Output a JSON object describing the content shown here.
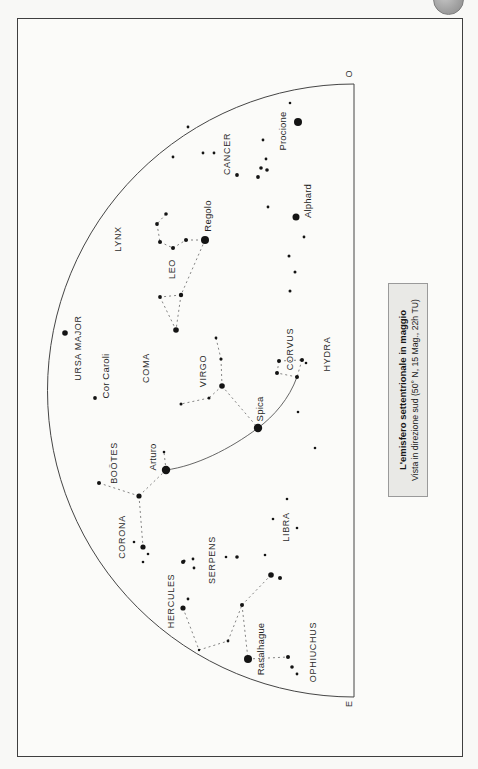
{
  "caption": {
    "title": "L'emisfero settentrionale in maggio",
    "subtitle": "Vista in direzione sud (50° N, 15 Mag., 22h TU)"
  },
  "horizon": {
    "west_label": "O",
    "east_label": "E"
  },
  "colors": {
    "star": "#141414",
    "figure_line": "#666666",
    "guide_line": "#555555",
    "outline": "#454545",
    "caption_bg": "#e9e9e6",
    "badge": "#a3a3a3"
  },
  "map": {
    "constellation_labels": [
      {
        "label": "LYNX",
        "x": 118,
        "y": 239
      },
      {
        "label": "CANCER",
        "x": 227,
        "y": 154
      },
      {
        "label": "URSA MAJOR",
        "x": 78,
        "y": 348
      },
      {
        "label": "LEO",
        "x": 172,
        "y": 269
      },
      {
        "label": "COMA",
        "x": 146,
        "y": 368
      },
      {
        "label": "VIRGO",
        "x": 203,
        "y": 371
      },
      {
        "label": "CORVUS",
        "x": 290,
        "y": 349
      },
      {
        "label": "HYDRA",
        "x": 327,
        "y": 354
      },
      {
        "label": "BOÖTES",
        "x": 114,
        "y": 463
      },
      {
        "label": "CORONA",
        "x": 122,
        "y": 537
      },
      {
        "label": "LIBRA",
        "x": 286,
        "y": 527
      },
      {
        "label": "SERPENS",
        "x": 212,
        "y": 560
      },
      {
        "label": "HERCULES",
        "x": 171,
        "y": 601
      },
      {
        "label": "OPHIUCHUS",
        "x": 313,
        "y": 652
      }
    ],
    "star_labels": [
      {
        "label": "Procione",
        "x": 283,
        "y": 131
      },
      {
        "label": "Regolo",
        "x": 208,
        "y": 216
      },
      {
        "label": "Alphard",
        "x": 308,
        "y": 201
      },
      {
        "label": "Cor Caroli",
        "x": 106,
        "y": 376
      },
      {
        "label": "Arturo",
        "x": 153,
        "y": 457
      },
      {
        "label": "Spica",
        "x": 260,
        "y": 409
      },
      {
        "label": "Rasalhague",
        "x": 261,
        "y": 649
      }
    ],
    "stars": [
      [
        290,
        103,
        1.3
      ],
      [
        298,
        122,
        4.0
      ],
      [
        188,
        127,
        1.4
      ],
      [
        173,
        157,
        1.4
      ],
      [
        203,
        153,
        1.4
      ],
      [
        214,
        153,
        1.4
      ],
      [
        263,
        140,
        1.4
      ],
      [
        266,
        159,
        1.4
      ],
      [
        261,
        168,
        1.8
      ],
      [
        267,
        170,
        1.8
      ],
      [
        258,
        177,
        1.9
      ],
      [
        237,
        175,
        1.9
      ],
      [
        268,
        207,
        1.4
      ],
      [
        296,
        217,
        3.5
      ],
      [
        304,
        237,
        1.4
      ],
      [
        289,
        256,
        1.5
      ],
      [
        295,
        272,
        1.5
      ],
      [
        290,
        291,
        1.5
      ],
      [
        166,
        214,
        1.8
      ],
      [
        157,
        224,
        1.9
      ],
      [
        160,
        242,
        2.0
      ],
      [
        173,
        248,
        2.0
      ],
      [
        186,
        240,
        2.0
      ],
      [
        205,
        240,
        4.0
      ],
      [
        160,
        297,
        1.9
      ],
      [
        181,
        295,
        2.2
      ],
      [
        176,
        330,
        2.8
      ],
      [
        65,
        333,
        2.8
      ],
      [
        95,
        398,
        1.9
      ],
      [
        216,
        338,
        1.4
      ],
      [
        221,
        359,
        1.6
      ],
      [
        222,
        386,
        2.8
      ],
      [
        209,
        398,
        1.5
      ],
      [
        181,
        404,
        1.5
      ],
      [
        258,
        428,
        4.2
      ],
      [
        279,
        361,
        2.0
      ],
      [
        302,
        360,
        2.0
      ],
      [
        306,
        363,
        1.3
      ],
      [
        277,
        373,
        2.0
      ],
      [
        297,
        377,
        2.0
      ],
      [
        298,
        412,
        1.3
      ],
      [
        315,
        448,
        1.3
      ],
      [
        287,
        499,
        1.3
      ],
      [
        273,
        519,
        1.3
      ],
      [
        297,
        528,
        1.3
      ],
      [
        265,
        555,
        1.3
      ],
      [
        237,
        557,
        1.8
      ],
      [
        226,
        557,
        1.3
      ],
      [
        164,
        452,
        1.3
      ],
      [
        166,
        470,
        4.2
      ],
      [
        139,
        496,
        2.6
      ],
      [
        99,
        483,
        2.0
      ],
      [
        134,
        542,
        1.3
      ],
      [
        143,
        547,
        2.6
      ],
      [
        148,
        554,
        1.3
      ],
      [
        143,
        562,
        1.3
      ],
      [
        184,
        561,
        1.6
      ],
      [
        193,
        559,
        1.4
      ],
      [
        194,
        568,
        1.4
      ],
      [
        271,
        575,
        2.8
      ],
      [
        280,
        578,
        2.0
      ],
      [
        183,
        562,
        2.0
      ],
      [
        188,
        599,
        1.4
      ],
      [
        183,
        608,
        2.6
      ],
      [
        199,
        650,
        1.2
      ],
      [
        228,
        641,
        1.4
      ],
      [
        242,
        605,
        2.0
      ],
      [
        248,
        659,
        4.0
      ],
      [
        288,
        657,
        2.0
      ],
      [
        292,
        667,
        1.8
      ],
      [
        297,
        674,
        1.4
      ]
    ],
    "figure_lines": [
      [
        166,
        214,
        157,
        224
      ],
      [
        157,
        224,
        160,
        242
      ],
      [
        160,
        242,
        173,
        248
      ],
      [
        173,
        248,
        186,
        240
      ],
      [
        186,
        240,
        205,
        240
      ],
      [
        205,
        240,
        181,
        295
      ],
      [
        181,
        295,
        160,
        297
      ],
      [
        160,
        297,
        176,
        330
      ],
      [
        181,
        295,
        176,
        330
      ],
      [
        216,
        338,
        221,
        359
      ],
      [
        221,
        359,
        222,
        386
      ],
      [
        222,
        386,
        209,
        398
      ],
      [
        209,
        398,
        181,
        404
      ],
      [
        222,
        386,
        258,
        428
      ],
      [
        279,
        361,
        302,
        360
      ],
      [
        302,
        360,
        297,
        377
      ],
      [
        297,
        377,
        277,
        373
      ],
      [
        277,
        373,
        279,
        361
      ],
      [
        166,
        470,
        164,
        452
      ],
      [
        166,
        470,
        139,
        496
      ],
      [
        139,
        496,
        99,
        483
      ],
      [
        139,
        496,
        143,
        547
      ],
      [
        183,
        608,
        199,
        650
      ],
      [
        199,
        650,
        228,
        641
      ],
      [
        228,
        641,
        242,
        605
      ],
      [
        242,
        605,
        271,
        575
      ],
      [
        242,
        605,
        248,
        659
      ],
      [
        248,
        659,
        288,
        657
      ]
    ],
    "guide_line": {
      "path": "M166,470 C196,466 230,449 258,428 C274,416 289,399 297,377"
    },
    "dome": {
      "arc_path": "M354,84 A306.5,306.5 0 0 0 354,697",
      "horizon_x": 354,
      "top_y": 84,
      "bottom_y": 697
    }
  }
}
